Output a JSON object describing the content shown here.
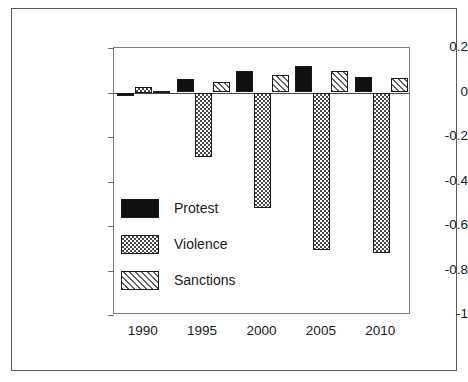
{
  "chart_data": {
    "type": "bar",
    "title": "",
    "subtitle": "",
    "xlabel": "",
    "ylabel": "Percent Change from Reference Run",
    "categories": [
      "1990",
      "1995",
      "2000",
      "2005",
      "2010"
    ],
    "series": [
      {
        "name": "Protest",
        "fill": "solid-black",
        "values": [
          -0.015,
          0.06,
          0.095,
          0.12,
          0.07
        ]
      },
      {
        "name": "Violence",
        "fill": "checker-hatch",
        "values": [
          0.025,
          -0.29,
          -0.52,
          -0.71,
          -0.72
        ]
      },
      {
        "name": "Sanctions",
        "fill": "diagonal-hatch",
        "values": [
          0.005,
          0.045,
          0.08,
          0.095,
          0.065
        ]
      }
    ],
    "ylim": [
      -1,
      0.2
    ],
    "yticks": [
      0.2,
      0,
      -0.2,
      -0.4,
      -0.6,
      -0.8,
      -1
    ],
    "ytick_labels": [
      "0.2",
      "0",
      "-0.2",
      "-0.4",
      "-0.6",
      "-0.8",
      "-1"
    ],
    "xlim": [
      1987.5,
      2012.5
    ],
    "grid": false,
    "zero_line": true,
    "legend_position": "inside-lower-left",
    "legend": [
      "Protest",
      "Violence",
      "Sanctions"
    ],
    "colors": {
      "protest": "#101010",
      "violence": "#4a4a4a",
      "sanctions": "#5f5f5f",
      "axis": "#7d7d7d",
      "frame": "#5a5a5a",
      "text": "#1a1a1a",
      "background": "#ffffff"
    }
  }
}
